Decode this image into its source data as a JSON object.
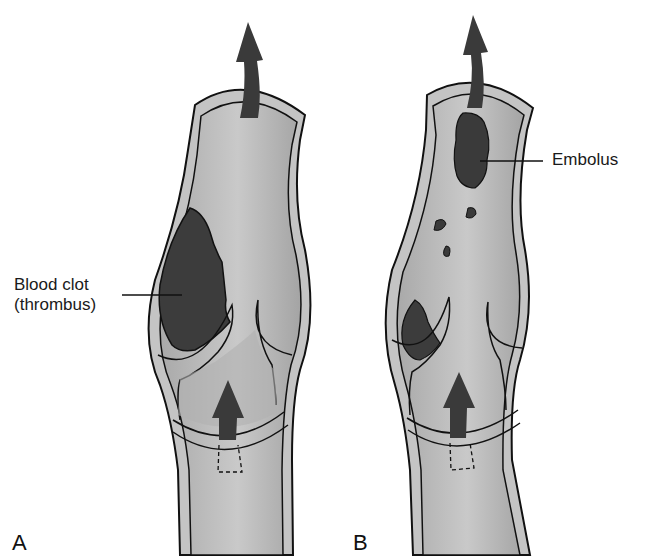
{
  "figure": {
    "panels": [
      {
        "letter": "A",
        "labels": [
          {
            "line1": "Blood clot",
            "line2": "(thrombus)"
          }
        ]
      },
      {
        "letter": "B",
        "labels": [
          {
            "text": "Embolus"
          }
        ]
      }
    ],
    "colors": {
      "vessel_wall": "#c8c8c8",
      "vessel_lumen": "#b5b5b5",
      "clot": "#3c3c3c",
      "arrow": "#3a3a3a",
      "outline": "#111111",
      "background": "#ffffff"
    }
  }
}
